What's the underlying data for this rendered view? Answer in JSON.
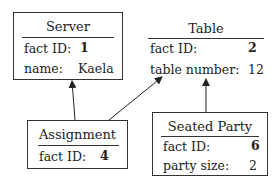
{
  "entities": [
    {
      "name": "Server",
      "fields": [
        {
          "label": "fact ID:",
          "value": "1",
          "bold": true
        },
        {
          "label": "name:",
          "value": "Kaela",
          "bold": false
        }
      ]
    },
    {
      "name": "Table",
      "fields": [
        {
          "label": "fact ID:",
          "value": "2",
          "bold": true
        },
        {
          "label": "table number:",
          "value": "12",
          "bold": false
        }
      ]
    },
    {
      "name": "Assignment",
      "fields": [
        {
          "label": "fact ID:",
          "value": "4",
          "bold": true
        }
      ]
    },
    {
      "name": "Seated Party",
      "fields": [
        {
          "label": "fact ID:",
          "value": "6",
          "bold": true
        },
        {
          "label": "party size:",
          "value": "2",
          "bold": false
        }
      ]
    }
  ],
  "relations": [
    {
      "from": "Assignment",
      "to": "Server"
    },
    {
      "from": "Assignment",
      "to": "Table"
    },
    {
      "from": "Seated Party",
      "to": "Table"
    }
  ]
}
